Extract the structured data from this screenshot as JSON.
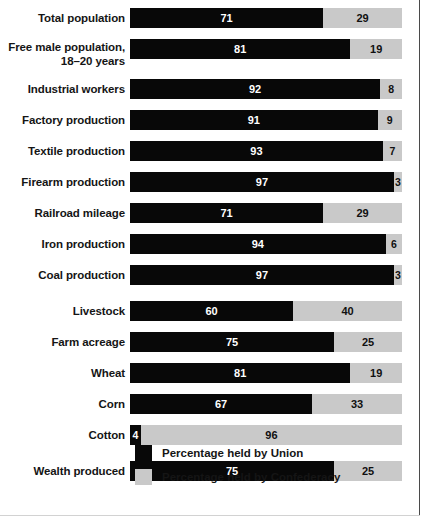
{
  "chart_data": {
    "type": "bar",
    "subtype": "stacked-horizontal-100pct",
    "title": "",
    "xlabel": "",
    "ylabel": "",
    "xlim": [
      0,
      100
    ],
    "grid": false,
    "legend_position": "bottom-left",
    "categories": [
      "Total population",
      "Free male population, 18–20 years",
      "Industrial workers",
      "Factory production",
      "Textile production",
      "Firearm production",
      "Railroad mileage",
      "Iron production",
      "Coal production",
      "Livestock",
      "Farm acreage",
      "Wheat",
      "Corn",
      "Cotton",
      "Wealth produced"
    ],
    "series": [
      {
        "name": "Percentage held by Union",
        "color": "#080808",
        "values": [
          71,
          81,
          92,
          91,
          93,
          97,
          71,
          94,
          97,
          60,
          75,
          81,
          67,
          4,
          75
        ]
      },
      {
        "name": "Percentage held by Confederacy",
        "color": "#c9c9c9",
        "values": [
          29,
          19,
          8,
          9,
          7,
          3,
          29,
          6,
          3,
          40,
          25,
          19,
          33,
          96,
          25
        ]
      }
    ]
  },
  "rows": [
    {
      "label_lines": [
        "Total population"
      ],
      "union": 71,
      "confederacy": 29,
      "union_text": "71",
      "confederacy_text": "29",
      "group_break": false
    },
    {
      "label_lines": [
        "Free male population,",
        "18–20 years"
      ],
      "union": 81,
      "confederacy": 19,
      "union_text": "81",
      "confederacy_text": "19",
      "group_break": false
    },
    {
      "label_lines": [
        "Industrial workers"
      ],
      "union": 92,
      "confederacy": 8,
      "union_text": "92",
      "confederacy_text": "8",
      "group_break": false
    },
    {
      "label_lines": [
        "Factory production"
      ],
      "union": 91,
      "confederacy": 9,
      "union_text": "91",
      "confederacy_text": "9",
      "group_break": false
    },
    {
      "label_lines": [
        "Textile production"
      ],
      "union": 93,
      "confederacy": 7,
      "union_text": "93",
      "confederacy_text": "7",
      "group_break": false
    },
    {
      "label_lines": [
        "Firearm production"
      ],
      "union": 97,
      "confederacy": 3,
      "union_text": "97",
      "confederacy_text": "3",
      "group_break": false
    },
    {
      "label_lines": [
        "Railroad mileage"
      ],
      "union": 71,
      "confederacy": 29,
      "union_text": "71",
      "confederacy_text": "29",
      "group_break": false
    },
    {
      "label_lines": [
        "Iron production"
      ],
      "union": 94,
      "confederacy": 6,
      "union_text": "94",
      "confederacy_text": "6",
      "group_break": false
    },
    {
      "label_lines": [
        "Coal production"
      ],
      "union": 97,
      "confederacy": 3,
      "union_text": "97",
      "confederacy_text": "3",
      "group_break": true
    },
    {
      "label_lines": [
        "Livestock"
      ],
      "union": 60,
      "confederacy": 40,
      "union_text": "60",
      "confederacy_text": "40",
      "group_break": false
    },
    {
      "label_lines": [
        "Farm acreage"
      ],
      "union": 75,
      "confederacy": 25,
      "union_text": "75",
      "confederacy_text": "25",
      "group_break": false
    },
    {
      "label_lines": [
        "Wheat"
      ],
      "union": 81,
      "confederacy": 19,
      "union_text": "81",
      "confederacy_text": "19",
      "group_break": false
    },
    {
      "label_lines": [
        "Corn"
      ],
      "union": 67,
      "confederacy": 33,
      "union_text": "67",
      "confederacy_text": "33",
      "group_break": false
    },
    {
      "label_lines": [
        "Cotton"
      ],
      "union": 4,
      "confederacy": 96,
      "union_text": "4",
      "confederacy_text": "96",
      "group_break": true
    },
    {
      "label_lines": [
        "Wealth produced"
      ],
      "union": 75,
      "confederacy": 25,
      "union_text": "75",
      "confederacy_text": "25",
      "group_break": false
    }
  ],
  "legend": {
    "items": [
      {
        "label": "Percentage held by Union",
        "color": "#080808",
        "key": "union"
      },
      {
        "label": "Percentage held by Confederacy",
        "color": "#c9c9c9",
        "key": "conf"
      }
    ]
  },
  "colors": {
    "union": "#080808",
    "confederacy": "#c9c9c9",
    "text": "#151515",
    "background": "#ffffff",
    "frame_rule": "#4a4a4a"
  }
}
